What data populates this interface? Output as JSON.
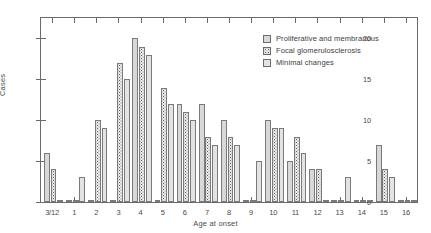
{
  "chart_data": {
    "type": "bar",
    "title": "",
    "xlabel": "Age at onset",
    "ylabel": "Cases",
    "ylim": [
      0,
      22.5
    ],
    "yticks": [
      0,
      5,
      10,
      15,
      20
    ],
    "grid": false,
    "legend_position": "top-right",
    "categories": [
      "3/12",
      "1",
      "2",
      "3",
      "4",
      "5",
      "6",
      "7",
      "8",
      "9",
      "10",
      "11",
      "12",
      "13",
      "14",
      "15",
      "16"
    ],
    "series": [
      {
        "name": "Proliferative and membranous",
        "values": [
          6,
          0,
          0,
          0,
          20,
          0,
          12,
          12,
          10,
          0,
          10,
          5,
          4,
          0,
          0,
          7,
          0
        ]
      },
      {
        "name": "Focal glomerulosclerosis",
        "values": [
          4,
          0,
          10,
          17,
          19,
          14,
          11,
          8,
          8,
          0,
          9,
          8,
          4,
          0,
          0,
          4,
          0
        ]
      },
      {
        "name": "Minimal changes",
        "values": [
          0,
          3,
          9,
          15,
          18,
          12,
          10,
          7,
          7,
          5,
          9,
          6,
          0,
          3,
          0,
          3,
          0
        ]
      }
    ]
  },
  "legend": {
    "items": [
      {
        "label": "Proliferative and membranous",
        "swatch": "dense-dark-stipple-swatch"
      },
      {
        "label": "Focal glomerulosclerosis",
        "swatch": "light-stipple-swatch"
      },
      {
        "label": "Minimal changes",
        "swatch": "plain-fill-swatch"
      }
    ]
  }
}
